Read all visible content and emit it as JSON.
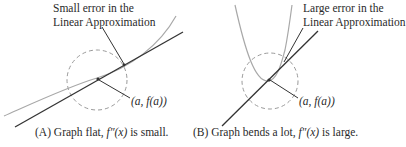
{
  "panel_a": {
    "annotation_line1": "Small error in the",
    "annotation_line2": "Linear Approximation",
    "point_label": "(a, f(a))",
    "caption_prefix": "(A) Graph flat, ",
    "caption_math": "f″(x)",
    "caption_suffix": " is small."
  },
  "panel_b": {
    "annotation_line1": "Large error in the",
    "annotation_line2": "Linear Approximation",
    "point_label": "(a, f(a))",
    "caption_prefix": "(B) Graph bends a lot, ",
    "caption_math": "f″(x)",
    "caption_suffix": " is large."
  },
  "colors": {
    "curve": "#a8a8a8",
    "tangent": "#333333",
    "circle": "#9a9a9a",
    "text": "#2a2a2a"
  }
}
